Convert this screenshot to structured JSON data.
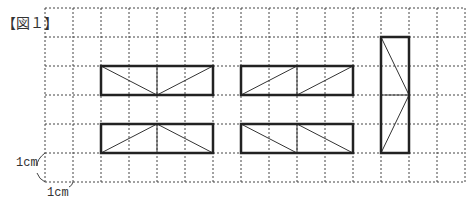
{
  "figure": {
    "label": "【図１】",
    "unit_vertical": "1cm",
    "unit_horizontal": "1cm"
  },
  "grid": {
    "origin_x": 45,
    "origin_y": 8,
    "cell_w": 28,
    "cell_h": 29,
    "cols": 15,
    "rows": 6,
    "line_color": "#444"
  },
  "shapes": [
    {
      "name": "rectangle-a",
      "x": 2,
      "y": 2,
      "w": 4,
      "h": 1,
      "lines": [
        [
          2,
          2,
          4,
          3
        ],
        [
          4,
          3,
          6,
          2
        ],
        [
          4,
          2,
          4,
          3
        ]
      ]
    },
    {
      "name": "rectangle-b",
      "x": 2,
      "y": 4,
      "w": 4,
      "h": 1,
      "lines": [
        [
          2,
          5,
          4,
          4
        ],
        [
          4,
          4,
          6,
          5
        ],
        [
          4,
          4,
          4,
          5
        ]
      ]
    },
    {
      "name": "rectangle-c",
      "x": 7,
      "y": 2,
      "w": 4,
      "h": 1,
      "lines": [
        [
          7,
          3,
          9,
          2
        ],
        [
          9,
          3,
          11,
          2
        ],
        [
          9,
          2,
          9,
          3
        ]
      ]
    },
    {
      "name": "rectangle-d",
      "x": 7,
      "y": 4,
      "w": 4,
      "h": 1,
      "lines": [
        [
          7,
          4,
          9,
          5
        ],
        [
          9,
          4,
          11,
          5
        ],
        [
          9,
          4,
          9,
          5
        ]
      ]
    },
    {
      "name": "rectangle-e",
      "x": 12,
      "y": 1,
      "w": 1,
      "h": 4,
      "lines": [
        [
          12,
          1,
          13,
          3
        ],
        [
          13,
          3,
          12,
          5
        ],
        [
          12,
          3,
          13,
          3
        ]
      ]
    }
  ]
}
